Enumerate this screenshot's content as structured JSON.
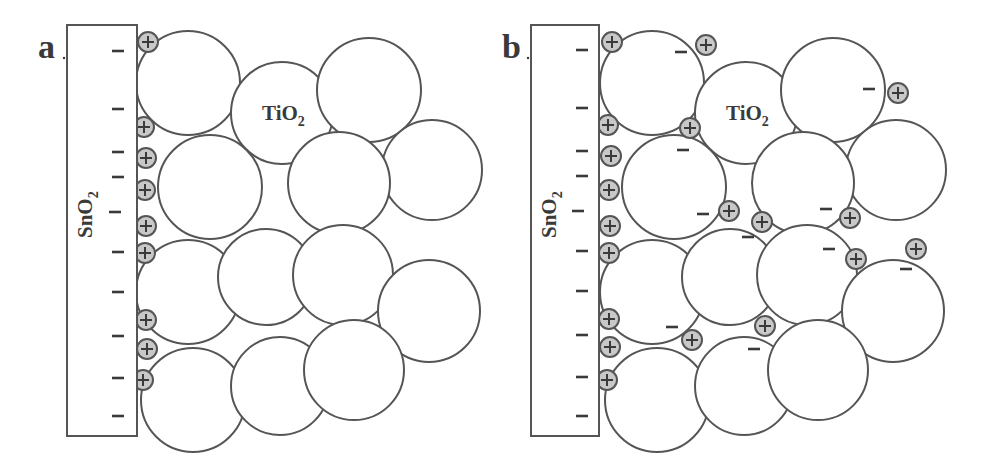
{
  "figure": {
    "colors": {
      "background": "#ffffff",
      "outline": "#555555",
      "hole_fill": "#c8c8c8",
      "text": "#3a3a3a"
    },
    "panels": [
      {
        "id": "a",
        "label": "a",
        "offset_x": 0,
        "substrate": {
          "label": "SnO",
          "label_sub": "2",
          "x": 67,
          "y": 25,
          "w": 70,
          "h": 411
        },
        "particle_label": {
          "text": "TiO",
          "sub": "2",
          "x": 262,
          "y": 120
        },
        "particles": [
          {
            "cx": 188,
            "cy": 83,
            "r": 52
          },
          {
            "cx": 282,
            "cy": 113,
            "r": 51
          },
          {
            "cx": 369,
            "cy": 90,
            "r": 52
          },
          {
            "cx": 432,
            "cy": 170,
            "r": 50
          },
          {
            "cx": 210,
            "cy": 187,
            "r": 52
          },
          {
            "cx": 339,
            "cy": 183,
            "r": 51
          },
          {
            "cx": 188,
            "cy": 292,
            "r": 52
          },
          {
            "cx": 266,
            "cy": 277,
            "r": 48
          },
          {
            "cx": 343,
            "cy": 275,
            "r": 50
          },
          {
            "cx": 429,
            "cy": 311,
            "r": 51
          },
          {
            "cx": 193,
            "cy": 400,
            "r": 52
          },
          {
            "cx": 280,
            "cy": 386,
            "r": 49
          },
          {
            "cx": 354,
            "cy": 370,
            "r": 50
          }
        ],
        "holes": [
          {
            "cx": 148,
            "cy": 42
          },
          {
            "cx": 144,
            "cy": 127
          },
          {
            "cx": 146,
            "cy": 158
          },
          {
            "cx": 145,
            "cy": 190
          },
          {
            "cx": 146,
            "cy": 226
          },
          {
            "cx": 145,
            "cy": 253
          },
          {
            "cx": 146,
            "cy": 320
          },
          {
            "cx": 147,
            "cy": 349
          },
          {
            "cx": 143,
            "cy": 380
          }
        ],
        "minus": [
          {
            "x": 118,
            "y": 51
          },
          {
            "x": 118,
            "y": 109
          },
          {
            "x": 118,
            "y": 152
          },
          {
            "x": 118,
            "y": 177
          },
          {
            "x": 115,
            "y": 212
          },
          {
            "x": 118,
            "y": 252
          },
          {
            "x": 118,
            "y": 292
          },
          {
            "x": 118,
            "y": 336
          },
          {
            "x": 118,
            "y": 378
          },
          {
            "x": 118,
            "y": 416
          }
        ]
      },
      {
        "id": "b",
        "label": "b",
        "offset_x": 464,
        "substrate": {
          "label": "SnO",
          "label_sub": "2",
          "x": 531,
          "y": 25,
          "w": 68,
          "h": 411
        },
        "particle_label": {
          "text": "TiO",
          "sub": "2",
          "x": 726,
          "y": 120
        },
        "particles": [
          {
            "cx": 652,
            "cy": 83,
            "r": 52
          },
          {
            "cx": 746,
            "cy": 113,
            "r": 51
          },
          {
            "cx": 833,
            "cy": 90,
            "r": 52
          },
          {
            "cx": 896,
            "cy": 170,
            "r": 50
          },
          {
            "cx": 674,
            "cy": 187,
            "r": 52
          },
          {
            "cx": 803,
            "cy": 183,
            "r": 51
          },
          {
            "cx": 652,
            "cy": 292,
            "r": 52
          },
          {
            "cx": 730,
            "cy": 277,
            "r": 48
          },
          {
            "cx": 807,
            "cy": 275,
            "r": 50
          },
          {
            "cx": 893,
            "cy": 311,
            "r": 51
          },
          {
            "cx": 657,
            "cy": 400,
            "r": 52
          },
          {
            "cx": 744,
            "cy": 386,
            "r": 49
          },
          {
            "cx": 818,
            "cy": 370,
            "r": 50
          }
        ],
        "holes": [
          {
            "cx": 612,
            "cy": 42
          },
          {
            "cx": 608,
            "cy": 125
          },
          {
            "cx": 611,
            "cy": 156
          },
          {
            "cx": 609,
            "cy": 190
          },
          {
            "cx": 610,
            "cy": 226
          },
          {
            "cx": 609,
            "cy": 253
          },
          {
            "cx": 609,
            "cy": 319
          },
          {
            "cx": 610,
            "cy": 347
          },
          {
            "cx": 607,
            "cy": 380
          },
          {
            "cx": 706,
            "cy": 45
          },
          {
            "cx": 690,
            "cy": 128
          },
          {
            "cx": 729,
            "cy": 211
          },
          {
            "cx": 762,
            "cy": 222
          },
          {
            "cx": 898,
            "cy": 93
          },
          {
            "cx": 850,
            "cy": 218
          },
          {
            "cx": 856,
            "cy": 259
          },
          {
            "cx": 916,
            "cy": 249
          },
          {
            "cx": 692,
            "cy": 340
          },
          {
            "cx": 765,
            "cy": 326
          }
        ],
        "minus": [
          {
            "x": 582,
            "y": 50
          },
          {
            "x": 582,
            "y": 108
          },
          {
            "x": 582,
            "y": 151
          },
          {
            "x": 582,
            "y": 176
          },
          {
            "x": 578,
            "y": 211
          },
          {
            "x": 582,
            "y": 251
          },
          {
            "x": 582,
            "y": 291
          },
          {
            "x": 582,
            "y": 335
          },
          {
            "x": 582,
            "y": 377
          },
          {
            "x": 582,
            "y": 416
          },
          {
            "x": 681,
            "y": 52
          },
          {
            "x": 683,
            "y": 150
          },
          {
            "x": 703,
            "y": 214
          },
          {
            "x": 869,
            "y": 89
          },
          {
            "x": 826,
            "y": 209
          },
          {
            "x": 748,
            "y": 237
          },
          {
            "x": 829,
            "y": 249
          },
          {
            "x": 906,
            "y": 269
          },
          {
            "x": 672,
            "y": 327
          },
          {
            "x": 754,
            "y": 349
          }
        ]
      }
    ]
  }
}
